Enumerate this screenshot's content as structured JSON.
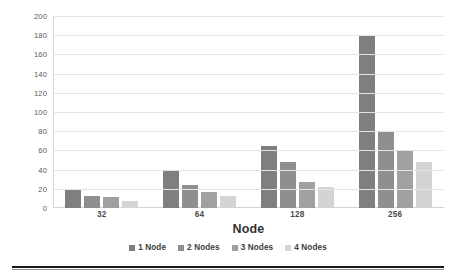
{
  "chart_data": {
    "type": "bar",
    "title": "",
    "xlabel": "Node",
    "ylabel": "Simulation Time (s)",
    "categories": [
      "32",
      "64",
      "128",
      "256"
    ],
    "ylim": [
      0,
      200
    ],
    "yticks": [
      0,
      20,
      40,
      60,
      80,
      100,
      120,
      140,
      160,
      180,
      200
    ],
    "ytick_labels": [
      "0",
      "20",
      "40",
      "60",
      "80",
      "100",
      "120",
      "140",
      "160",
      "180",
      "200"
    ],
    "grid": true,
    "legend_position": "bottom",
    "series": [
      {
        "name": "1 Node",
        "color": "#7f7f7f",
        "values": [
          20,
          40,
          65,
          180
        ]
      },
      {
        "name": "2 Nodes",
        "color": "#8f8f8f",
        "values": [
          13,
          24,
          48,
          79
        ]
      },
      {
        "name": "3 Nodes",
        "color": "#a0a0a0",
        "values": [
          11,
          17,
          27,
          60
        ]
      },
      {
        "name": "4 Nodes",
        "color": "#d4d4d4",
        "values": [
          7,
          12,
          22,
          48
        ]
      }
    ]
  },
  "axis": {
    "y_title": "Simulation Time (s)",
    "x_title": "Node"
  },
  "legend": {
    "items": [
      {
        "label": "1 Node"
      },
      {
        "label": "2 Nodes"
      },
      {
        "label": "3 Nodes"
      },
      {
        "label": "4 Nodes"
      }
    ]
  }
}
